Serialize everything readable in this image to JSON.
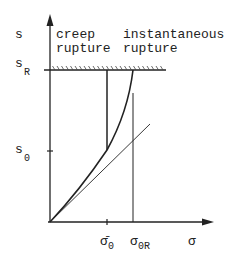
{
  "labels": {
    "y_axis": "s",
    "s_R": "s",
    "s_R_sub": "R",
    "s_0": "s",
    "s_0_sub": "0",
    "creep_1": "creep",
    "creep_2": "rupture",
    "inst_1": "instantaneous",
    "inst_2": "rupture",
    "sigma_bar_0": "σ̄",
    "sigma_bar_0_sub": "0",
    "sigma_0R": "σ",
    "sigma_0R_sub": "0R",
    "x_axis": "σ"
  },
  "colors": {
    "ink": "#222222",
    "background": "#ffffff"
  }
}
